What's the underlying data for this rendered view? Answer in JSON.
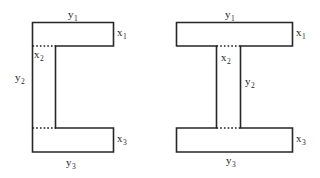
{
  "figure": {
    "background_color": "#ffffff",
    "line_color": "#262626",
    "dotted_line_color": "#1a1a1a",
    "text_color": "#1f1f1f",
    "panel_count": 2
  },
  "panels": [
    {
      "id": "channel-section",
      "shape_name": "channel-c-section",
      "description": "C-shaped (channel) cross-section with top flange, web and bottom flange",
      "labels": {
        "top_width": "y",
        "top_width_sub": "1",
        "top_thickness": "x",
        "top_thickness_sub": "1",
        "web_thickness": "x",
        "web_thickness_sub": "2",
        "web_height": "y",
        "web_height_sub": "2",
        "bottom_thickness": "x",
        "bottom_thickness_sub": "3",
        "bottom_width": "y",
        "bottom_width_sub": "3"
      }
    },
    {
      "id": "i-beam-section",
      "shape_name": "i-beam-section",
      "description": "I-shaped (wide flange) cross-section with top flange, central web and bottom flange",
      "labels": {
        "top_width": "y",
        "top_width_sub": "1",
        "top_thickness": "x",
        "top_thickness_sub": "1",
        "web_thickness": "x",
        "web_thickness_sub": "2",
        "web_height": "y",
        "web_height_sub": "2",
        "bottom_thickness": "x",
        "bottom_thickness_sub": "3",
        "bottom_width": "y",
        "bottom_width_sub": "3"
      }
    }
  ],
  "geometry": {
    "channel": {
      "outline": "M 32.5,22.5 L 113.5,22.5 L 113.5,46 L 55.5,46 L 55.5,128 L 113.5,128 L 113.5,152 L 32.5,152 Z",
      "dotted_top": {
        "x1": 32.5,
        "y1": 46,
        "x2": 55.5,
        "y2": 46
      },
      "dotted_bottom": {
        "x1": 32.5,
        "y1": 128,
        "x2": 55.5,
        "y2": 128
      }
    },
    "ibeam": {
      "outline": "M 176.5,22.5 L 292.5,22.5 L 292.5,46 L 240.5,46 L 240.5,128 L 292.5,128 L 292.5,152 L 176.5,152 L 176.5,128 L 216.5,128 L 216.5,46 L 176.5,46 Z",
      "dotted_top": {
        "x1": 216.5,
        "y1": 46,
        "x2": 240.5,
        "y2": 46
      },
      "dotted_bottom": {
        "x1": 216.5,
        "y1": 128,
        "x2": 240.5,
        "y2": 128
      }
    }
  }
}
